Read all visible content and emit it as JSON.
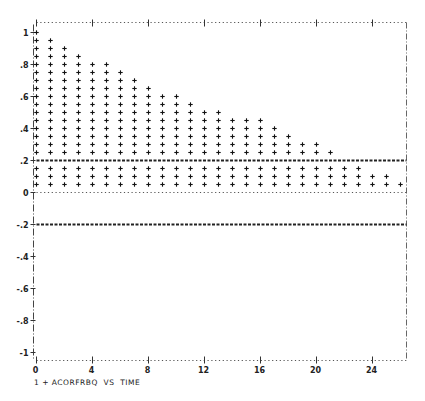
{
  "chart_data": {
    "type": "scatter",
    "title": "",
    "caption": "1 + ACORFRBQ  VS  TIME",
    "xlabel": "TIME (lag)",
    "ylabel": "ACORFRBQ",
    "xlim": [
      0,
      26
    ],
    "ylim": [
      -1,
      1
    ],
    "x_ticks": [
      0,
      4,
      8,
      12,
      16,
      20,
      24
    ],
    "y_ticks": [
      1,
      0.8,
      0.6,
      0.4,
      0.2,
      0,
      -0.2,
      -0.4,
      -0.6,
      -0.8,
      -1
    ],
    "y_tick_labels": [
      "1",
      ".8",
      ".6",
      ".4",
      ".2",
      "0",
      "-.2",
      "-.4",
      "-.6",
      "-.8",
      "-1"
    ],
    "grid": false,
    "confidence_bands": [
      0.2,
      -0.2
    ],
    "plot_symbol": "+",
    "symbol_step": 0.05,
    "series": [
      {
        "name": "ACORFRBQ",
        "legend_symbol": "1 +",
        "x": [
          0,
          1,
          2,
          3,
          4,
          5,
          6,
          7,
          8,
          9,
          10,
          11,
          12,
          13,
          14,
          15,
          16,
          17,
          18,
          19,
          20,
          21,
          22,
          23,
          24,
          25,
          26
        ],
        "values": [
          1.0,
          0.95,
          0.9,
          0.85,
          0.8,
          0.8,
          0.75,
          0.7,
          0.65,
          0.6,
          0.6,
          0.55,
          0.5,
          0.5,
          0.45,
          0.45,
          0.45,
          0.4,
          0.35,
          0.3,
          0.3,
          0.25,
          0.15,
          0.15,
          0.1,
          0.1,
          0.05
        ]
      }
    ]
  },
  "caption": {
    "series_id": "1",
    "symbol": "+",
    "variable": "ACORFRBQ",
    "vs": "VS",
    "x_variable": "TIME"
  }
}
